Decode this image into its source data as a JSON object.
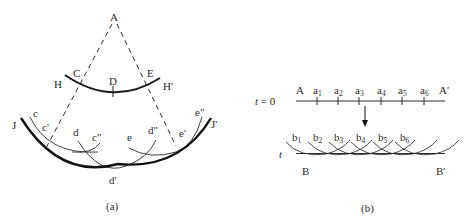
{
  "panel_a": {
    "caption": "(a)",
    "apex": "A",
    "inner_arc": {
      "left": "H",
      "right": "H'",
      "points": [
        "C",
        "D",
        "E"
      ]
    },
    "outer_arc": {
      "left": "J",
      "right": "J'",
      "bottom": "d'"
    },
    "wavelets": {
      "c": "c",
      "c1": "c'",
      "c2": "c\"",
      "d": "d",
      "d2": "d\"",
      "e": "e",
      "e1": "e'",
      "e2": "e\""
    }
  },
  "panel_b": {
    "caption": "(b)",
    "time0_label": "t = 0",
    "time_label": "t",
    "top_line": {
      "left": "A",
      "right": "A'",
      "points": [
        "a",
        "a",
        "a",
        "a",
        "a",
        "a"
      ],
      "subs": [
        "1",
        "2",
        "3",
        "4",
        "5",
        "6"
      ]
    },
    "bottom_line": {
      "left": "B",
      "right": "B'",
      "points": [
        "b",
        "b",
        "b",
        "b",
        "b",
        "b"
      ],
      "subs": [
        "1",
        "2",
        "3",
        "4",
        "5",
        "6"
      ]
    }
  }
}
